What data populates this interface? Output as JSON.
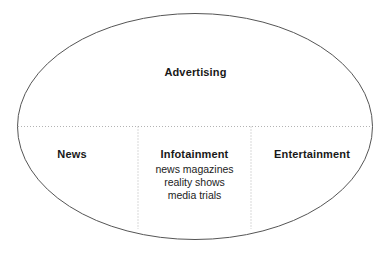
{
  "diagram": {
    "type": "venn-ellipse-segmented",
    "background_color": "#ffffff",
    "outline_color": "#555555",
    "divider_color": "#b3b3b3",
    "text_color": "#181818",
    "umbrella": {
      "title": "Advertising"
    },
    "regions": [
      {
        "key": "news",
        "title": "News",
        "items": []
      },
      {
        "key": "infotainment",
        "title": "Infotainment",
        "items": [
          "news magazines",
          "reality shows",
          "media trials"
        ]
      },
      {
        "key": "entertainment",
        "title": "Entertainment",
        "items": []
      }
    ]
  }
}
